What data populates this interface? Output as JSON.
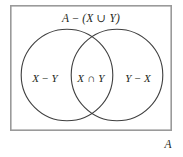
{
  "figure": {
    "type": "venn-diagram",
    "background_color": "#ffffff",
    "rectangle": {
      "name": "universal-set-box",
      "stroke_color": "#9a9a9a",
      "stroke_width": 1.6,
      "x": 10,
      "y": 5,
      "width": 162,
      "height": 126
    },
    "circles": [
      {
        "name": "set-x-circle",
        "set": "X",
        "cx": 67,
        "cy": 75,
        "r": 46,
        "stroke_color": "#3f3f3f",
        "stroke_width": 1.1,
        "fill": "none"
      },
      {
        "name": "set-y-circle",
        "set": "Y",
        "cx": 117,
        "cy": 75,
        "r": 46,
        "stroke_color": "#3f3f3f",
        "stroke_width": 1.1,
        "fill": "none"
      }
    ]
  },
  "labels": {
    "complement_of_union": "A − (X ∪ Y)",
    "x_minus_y": "X − Y",
    "x_intersect_y": "X ∩ Y",
    "y_minus_x": "Y − X",
    "universal_set": "A"
  },
  "regions": [
    {
      "name": "outside-both-circles",
      "label": "A − (X ∪ Y)",
      "meaning": "Elements of A in neither X nor Y"
    },
    {
      "name": "left-only",
      "label": "X − Y",
      "meaning": "Elements in X but not in Y"
    },
    {
      "name": "intersection",
      "label": "X ∩ Y",
      "meaning": "Elements in both X and Y"
    },
    {
      "name": "right-only",
      "label": "Y − X",
      "meaning": "Elements in Y but not in X"
    }
  ]
}
